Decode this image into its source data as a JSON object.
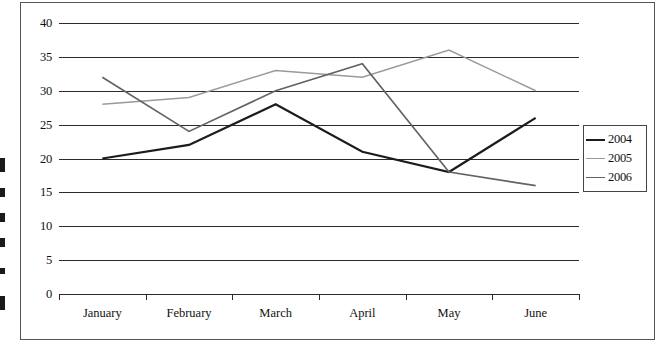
{
  "chart_data": {
    "type": "line",
    "title": "",
    "xlabel": "",
    "ylabel": "",
    "categories": [
      "January",
      "February",
      "March",
      "April",
      "May",
      "June"
    ],
    "series": [
      {
        "name": "2004",
        "values": [
          20,
          22,
          28,
          21,
          18,
          26
        ],
        "color": "#1c1c1c"
      },
      {
        "name": "2005",
        "values": [
          28,
          29,
          33,
          32,
          36,
          30
        ],
        "color": "#9a9a9a"
      },
      {
        "name": "2006",
        "values": [
          32,
          24,
          30,
          34,
          18,
          16
        ],
        "color": "#636363"
      }
    ],
    "ylim": [
      0,
      40
    ],
    "yticks": [
      0,
      5,
      10,
      15,
      20,
      25,
      30,
      35,
      40
    ],
    "grid": true,
    "legend_position": "right"
  },
  "legend": {
    "items": [
      {
        "label": "2004"
      },
      {
        "label": "2005"
      },
      {
        "label": "2006"
      }
    ]
  },
  "axes": {
    "y_tick_labels": [
      "40",
      "35",
      "30",
      "25",
      "20",
      "15",
      "10",
      "5",
      "0"
    ],
    "x_tick_labels": [
      "January",
      "February",
      "March",
      "April",
      "May",
      "June"
    ]
  },
  "colors": {
    "series_2004": "#1c1c1c",
    "series_2005": "#9a9a9a",
    "series_2006": "#636363",
    "gridline": "#2b2b2b",
    "frame": "#555555",
    "background": "#ffffff"
  }
}
